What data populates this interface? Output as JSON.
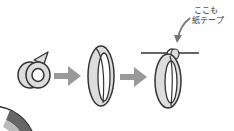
{
  "diagram": {
    "title": "",
    "steps": [
      {
        "id": "tape-roll",
        "label": ""
      },
      {
        "id": "tape-loop",
        "label": ""
      },
      {
        "id": "tape-loop-hung",
        "label": ""
      }
    ],
    "annotation": {
      "line1": "ここも",
      "line2": "紙テープ"
    },
    "colors": {
      "outline": "#333333",
      "fill": "#dddddd",
      "arrow": "#999999",
      "background": "#ffffff"
    }
  }
}
